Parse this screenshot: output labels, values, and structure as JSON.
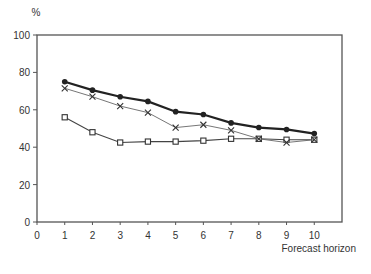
{
  "chart_data": {
    "type": "line",
    "title": "",
    "xlabel": "Forecast horizon",
    "ylabel": "%",
    "xlim": [
      0,
      11
    ],
    "ylim": [
      0,
      100
    ],
    "x_ticks": [
      0,
      1,
      2,
      3,
      4,
      5,
      6,
      7,
      8,
      9,
      10
    ],
    "y_ticks": [
      0,
      20,
      40,
      60,
      80,
      100
    ],
    "grid": false,
    "legend": null,
    "x": [
      1,
      2,
      3,
      4,
      5,
      6,
      7,
      8,
      9,
      10
    ],
    "series": [
      {
        "name": "circles (bold line)",
        "marker": "circle",
        "values": [
          75,
          70.5,
          67,
          64.5,
          59,
          57.5,
          53,
          50.5,
          49.5,
          47.3
        ]
      },
      {
        "name": "crosses (thin line)",
        "marker": "x",
        "values": [
          71.5,
          67,
          62,
          58.5,
          50.5,
          52,
          49,
          44.5,
          42.5,
          44
        ]
      },
      {
        "name": "squares",
        "marker": "square",
        "values": [
          56,
          48,
          42.5,
          43,
          43,
          43.5,
          44.5,
          44.5,
          44,
          44
        ]
      }
    ]
  },
  "labels": {
    "y_unit": "%",
    "x_axis_title": "Forecast horizon"
  }
}
